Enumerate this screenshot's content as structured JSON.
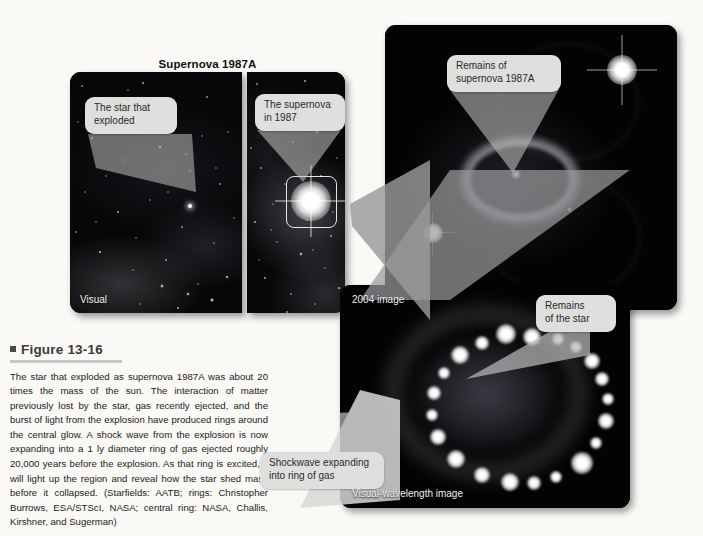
{
  "figure": {
    "title": "Supernova 1987A",
    "caption_heading": "Figure 13-16",
    "caption_text": "The star that exploded as supernova 1987A was about 20 times the mass of the sun. The interaction of matter previously lost by the star, gas recently ejected, and the burst of light from the explosion have produced rings around the central glow. A shock wave from the explosion is now expanding into a 1 ly diameter ring of gas ejected roughly 20,000 years before the explosion. As that ring is excited, it will light up the region and reveal how the star shed mass before it collapsed. (Starfields: AATB; rings: Christopher Burrows, ESA/STScI, NASA; central ring: NASA, Challis, Kirshner, and Sugerman)"
  },
  "panels": {
    "progenitor": {
      "corner_label": "Visual",
      "callout": "The star that\nexploded"
    },
    "supernova_1987": {
      "callout": "The supernova\nin 1987"
    },
    "remnant": {
      "callout": "Remains of\nsupernova 1987A"
    },
    "image_2004": {
      "corner_label_top": "2004 image",
      "corner_label_bottom": "Visual-wavelength image",
      "callout_star": "Remains\nof the star",
      "callout_shockwave": "Shockwave expanding\ninto ring of gas"
    }
  },
  "colors": {
    "page_background": "#faf9f6",
    "callout_fill": "#dfdfdd",
    "panel_background": "#050507",
    "caption_rule": "#c6c6c6",
    "knot_white": "#ffffff"
  },
  "ring_knots_2004": [
    {
      "cx": 146,
      "cy": 30,
      "r": 9
    },
    {
      "cx": 120,
      "cy": 27,
      "r": 10
    },
    {
      "cx": 172,
      "cy": 32,
      "r": 6
    },
    {
      "cx": 96,
      "cy": 36,
      "r": 7
    },
    {
      "cx": 190,
      "cy": 40,
      "r": 6
    },
    {
      "cx": 74,
      "cy": 48,
      "r": 9
    },
    {
      "cx": 206,
      "cy": 54,
      "r": 8
    },
    {
      "cx": 58,
      "cy": 66,
      "r": 6
    },
    {
      "cx": 216,
      "cy": 72,
      "r": 7
    },
    {
      "cx": 48,
      "cy": 86,
      "r": 7
    },
    {
      "cx": 222,
      "cy": 92,
      "r": 6
    },
    {
      "cx": 46,
      "cy": 108,
      "r": 6
    },
    {
      "cx": 220,
      "cy": 114,
      "r": 8
    },
    {
      "cx": 52,
      "cy": 130,
      "r": 8
    },
    {
      "cx": 210,
      "cy": 136,
      "r": 6
    },
    {
      "cx": 70,
      "cy": 152,
      "r": 9
    },
    {
      "cx": 196,
      "cy": 156,
      "r": 11
    },
    {
      "cx": 96,
      "cy": 168,
      "r": 8
    },
    {
      "cx": 170,
      "cy": 170,
      "r": 6
    },
    {
      "cx": 124,
      "cy": 175,
      "r": 9
    },
    {
      "cx": 148,
      "cy": 176,
      "r": 7
    }
  ]
}
